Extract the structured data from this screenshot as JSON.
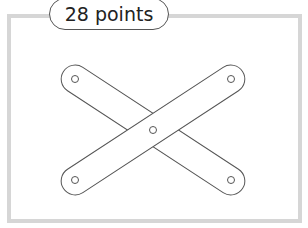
{
  "label": {
    "text": "28 points"
  },
  "figure": {
    "stroke_color": "#555555",
    "frame_color": "#d6d6d6"
  }
}
